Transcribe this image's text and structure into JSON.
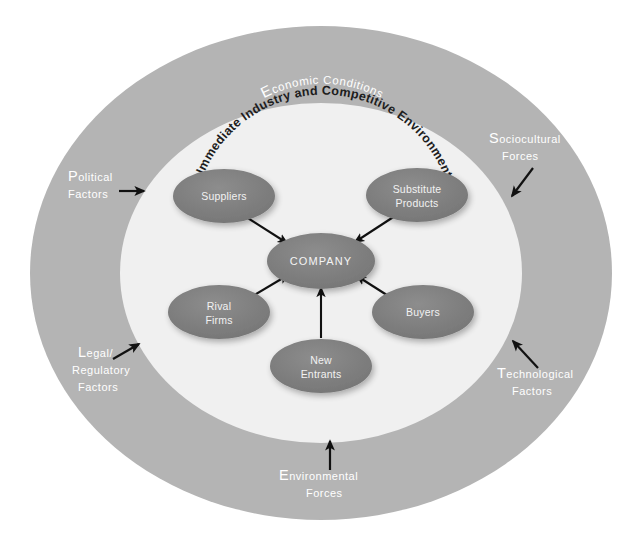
{
  "diagram": {
    "macro_ring": {
      "title": "MACRO-ENVIRONMENT",
      "subtitle_cap": "E",
      "subtitle_rest": "conomic Conditions",
      "color": "#b3b3b3"
    },
    "inner_ring": {
      "title": "Immediate Industry and Competitive Environment",
      "color": "#f0f0f0"
    },
    "nodes": [
      {
        "id": "suppliers",
        "label_line1": "Suppliers",
        "label_line2": "",
        "color": "#7f7f7f"
      },
      {
        "id": "substitute-products",
        "label_line1": "Substitute",
        "label_line2": "Products",
        "color": "#7f7f7f"
      },
      {
        "id": "company",
        "label_line1": "COMPANY",
        "label_line2": "",
        "color": "#767676"
      },
      {
        "id": "rival-firms",
        "label_line1": "Rival",
        "label_line2": "Firms",
        "color": "#8a8a8a"
      },
      {
        "id": "buyers",
        "label_line1": "Buyers",
        "label_line2": "",
        "color": "#7f7f7f"
      },
      {
        "id": "new-entrants",
        "label_line1": "New",
        "label_line2": "Entrants",
        "color": "#7f7f7f"
      }
    ],
    "external_labels": [
      {
        "id": "political",
        "cap": "P",
        "rest": "olitical",
        "line2": "Factors",
        "line3": ""
      },
      {
        "id": "sociocultural",
        "cap": "S",
        "rest": "ociocultural",
        "line2": "Forces",
        "line3": ""
      },
      {
        "id": "legal-regulatory",
        "cap": "L",
        "rest": "egal/",
        "line2": "Regulatory",
        "line3": "Factors"
      },
      {
        "id": "technological",
        "cap": "T",
        "rest": "echnological",
        "line2": "Factors",
        "line3": ""
      },
      {
        "id": "environmental",
        "cap": "E",
        "rest": "nvironmental",
        "line2": "Forces",
        "line3": ""
      }
    ]
  }
}
